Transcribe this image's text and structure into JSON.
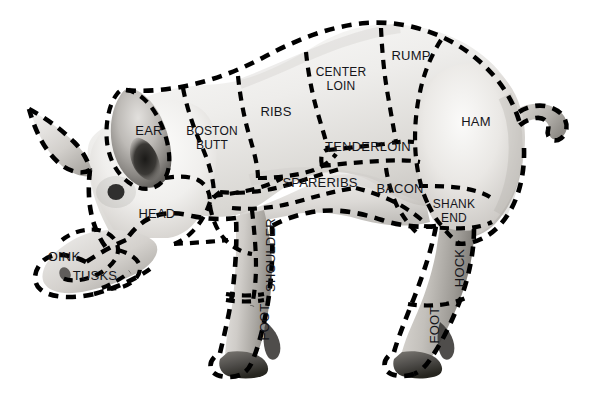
{
  "diagram": {
    "style": {
      "background": "#ffffff",
      "line_color": "#000000",
      "label_color": "#15151a",
      "body_light": "#f2f1ef",
      "body_mid": "#d7d5d2",
      "body_shadow": "#a7a4a0",
      "body_dark": "#6f6c69",
      "eye_color": "#111111"
    },
    "labels": [
      {
        "id": "ear",
        "text": "EAR",
        "x": 149,
        "y": 132,
        "rotate": 0,
        "lines": [
          "EAR"
        ]
      },
      {
        "id": "boston-butt",
        "text": "BOSTON BUTT",
        "x": 212,
        "y": 139,
        "rotate": 0,
        "lines": [
          "BOSTON",
          "BUTT"
        ]
      },
      {
        "id": "ribs",
        "text": "RIBS",
        "x": 276,
        "y": 113,
        "rotate": 0,
        "lines": [
          "RIBS"
        ]
      },
      {
        "id": "center-loin",
        "text": "CENTER LOIN",
        "x": 341,
        "y": 80,
        "rotate": 0,
        "lines": [
          "CENTER",
          "LOIN"
        ]
      },
      {
        "id": "rump",
        "text": "RUMP",
        "x": 411,
        "y": 57,
        "rotate": 0,
        "lines": [
          "RUMP"
        ]
      },
      {
        "id": "ham",
        "text": "HAM",
        "x": 476,
        "y": 123,
        "rotate": 0,
        "lines": [
          "HAM"
        ]
      },
      {
        "id": "tenderloin",
        "text": "TENDERLOIN",
        "x": 368,
        "y": 148,
        "rotate": 0,
        "lines": [
          "TENDERLOIN"
        ]
      },
      {
        "id": "spareribs",
        "text": "SPARERIBS",
        "x": 320,
        "y": 184,
        "rotate": 0,
        "lines": [
          "SPARERIBS"
        ]
      },
      {
        "id": "bacon",
        "text": "BACON",
        "x": 400,
        "y": 190,
        "rotate": 0,
        "lines": [
          "BACON"
        ]
      },
      {
        "id": "shank-end",
        "text": "SHANK END",
        "x": 454,
        "y": 212,
        "rotate": 0,
        "lines": [
          "SHANK",
          "END"
        ]
      },
      {
        "id": "head",
        "text": "HEAD",
        "x": 157,
        "y": 215,
        "rotate": 0,
        "lines": [
          "HEAD"
        ]
      },
      {
        "id": "oink",
        "text": "OINK",
        "x": 64,
        "y": 258,
        "rotate": 0,
        "lines": [
          "OINK"
        ]
      },
      {
        "id": "tusks",
        "text": "TUSKS",
        "x": 95,
        "y": 277,
        "rotate": 0,
        "lines": [
          "TUSKS"
        ]
      },
      {
        "id": "shoulder",
        "text": "SHOULDER",
        "x": 272,
        "y": 255,
        "rotate": -90,
        "lines": [
          "SHOULDER"
        ]
      },
      {
        "id": "foot-front",
        "text": "FOOT",
        "x": 266,
        "y": 322,
        "rotate": -90,
        "lines": [
          "FOOT"
        ]
      },
      {
        "id": "hock",
        "text": "HOCK",
        "x": 461,
        "y": 268,
        "rotate": -90,
        "lines": [
          "HOCK"
        ]
      },
      {
        "id": "foot-rear",
        "text": "FOOT",
        "x": 436,
        "y": 325,
        "rotate": -90,
        "lines": [
          "FOOT"
        ]
      }
    ],
    "cut_sections": [
      "EAR",
      "BOSTON BUTT",
      "RIBS",
      "CENTER LOIN",
      "RUMP",
      "HAM",
      "TENDERLOIN",
      "SPARERIBS",
      "BACON",
      "SHANK END",
      "HEAD",
      "OINK",
      "TUSKS",
      "SHOULDER",
      "FOOT",
      "HOCK",
      "FOOT"
    ]
  }
}
